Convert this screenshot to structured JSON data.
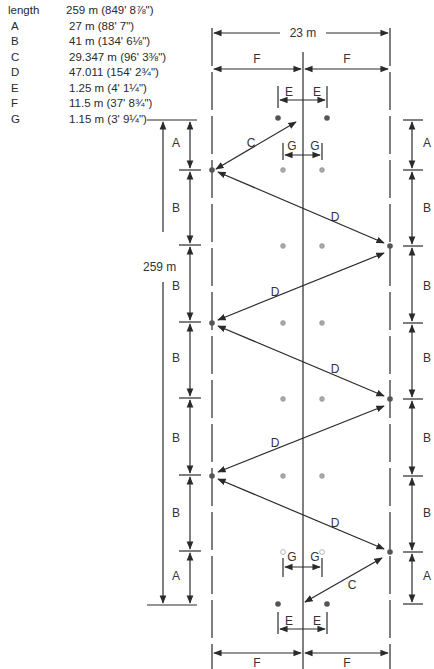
{
  "legend": [
    {
      "key": "length",
      "value": "259 m (849' 8⅞\")"
    },
    {
      "key": "A",
      "value": "27 m (88' 7\")"
    },
    {
      "key": "B",
      "value": "41 m (134' 6⅛\")"
    },
    {
      "key": "C",
      "value": "29.347 m (96' 3⅜\")"
    },
    {
      "key": "D",
      "value": "47.011 (154' 2¾\")"
    },
    {
      "key": "E",
      "value": "1.25 m (4' 1¼\")"
    },
    {
      "key": "F",
      "value": "11.5 m (37' 8¾\")"
    },
    {
      "key": "G",
      "value": "1.15 m (3' 9¼\")"
    }
  ],
  "diagram": {
    "width_label": "23 m",
    "length_label": "259 m",
    "half_width_label": "F",
    "e_label": "E",
    "g_label": "G",
    "c_label": "C",
    "d_label": "D",
    "left_stack": [
      "A",
      "B",
      "B",
      "B",
      "B",
      "B",
      "A"
    ],
    "right_stack": [
      "A",
      "B",
      "B",
      "B",
      "B",
      "B",
      "A"
    ],
    "colors": {
      "line": "#2a2a2a",
      "dot_dark": "#555555",
      "dot_light": "#9a9a9a"
    }
  }
}
